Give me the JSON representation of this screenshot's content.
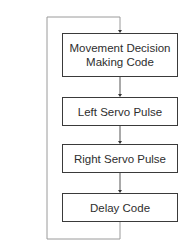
{
  "diagram": {
    "type": "flowchart-loop",
    "colors": {
      "line": "#555555",
      "box_border": "#3a3a3a",
      "text": "#2e2e2e",
      "loop_line": "#9a9a9a"
    },
    "nodes": [
      {
        "id": "n1",
        "label": "Movement Decision Making Code",
        "line1": "Movement Decision",
        "line2": "Making Code"
      },
      {
        "id": "n2",
        "label": "Left Servo Pulse"
      },
      {
        "id": "n3",
        "label": "Right Servo Pulse"
      },
      {
        "id": "n4",
        "label": "Delay Code"
      }
    ],
    "edges": [
      {
        "from": "n1",
        "to": "n2"
      },
      {
        "from": "n2",
        "to": "n3"
      },
      {
        "from": "n3",
        "to": "n4"
      },
      {
        "from": "n4",
        "to": "n1",
        "kind": "loop-back"
      }
    ]
  }
}
